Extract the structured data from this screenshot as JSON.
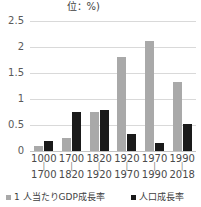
{
  "chart_data": {
    "type": "bar",
    "title": "位：%)",
    "xlabel": "",
    "ylabel": "",
    "ylim": [
      0,
      2.5
    ],
    "yticks": [
      "0",
      "0.5",
      "1",
      "1.5",
      "2",
      "2.5"
    ],
    "ytick_values": [
      0,
      0.5,
      1,
      1.5,
      2,
      2.5
    ],
    "grid": true,
    "legend_position": "bottom",
    "categories": [
      "1000\n1700",
      "1700\n1820",
      "1820\n1920",
      "1920\n1970",
      "1970\n1990",
      "1990\n2018"
    ],
    "category_starts": [
      "1000",
      "1700",
      "1820",
      "1920",
      "1970",
      "1990"
    ],
    "category_ends": [
      "1700",
      "1820",
      "1920",
      "1970",
      "1990",
      "2018"
    ],
    "series": [
      {
        "name": "1人当たりGDP成長率",
        "color": "#a9a9a9",
        "values": [
          0.1,
          0.25,
          0.75,
          1.8,
          2.12,
          1.32
        ]
      },
      {
        "name": "人口成長率",
        "color": "#1a1a1a",
        "values": [
          0.2,
          0.75,
          0.78,
          0.32,
          0.15,
          0.52
        ]
      }
    ]
  },
  "legend": {
    "items": [
      {
        "label": "1 人当たりGDP成長率",
        "color": "#a9a9a9"
      },
      {
        "label": "人口成長率",
        "color": "#1a1a1a"
      }
    ]
  }
}
